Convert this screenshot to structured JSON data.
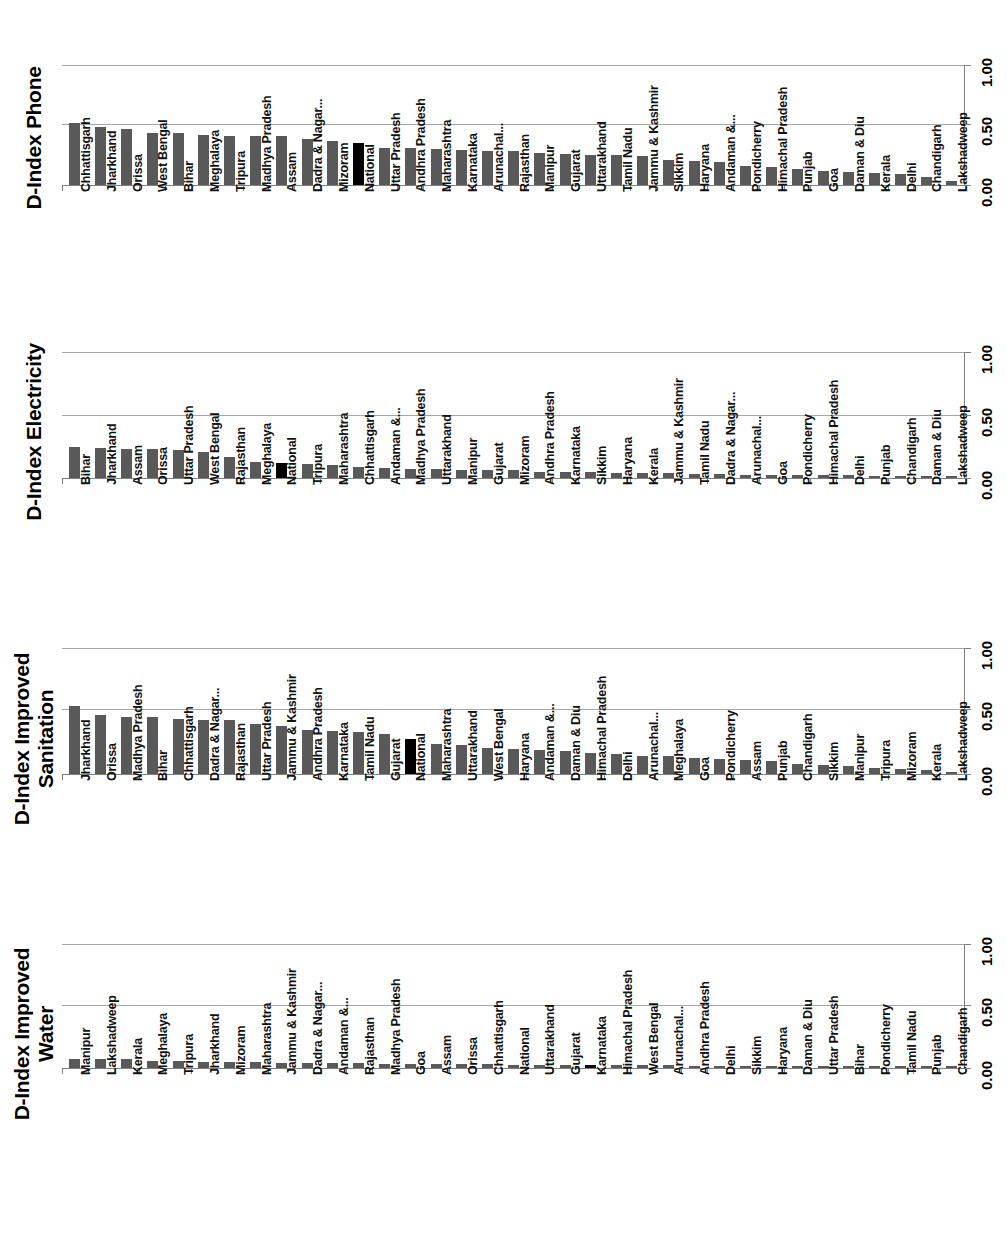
{
  "figure": {
    "axis_ticks": [
      "0.00",
      "0.50",
      "1.00"
    ],
    "axis_min": 0,
    "axis_max": 1,
    "bar_color": "#595959",
    "highlight_color": "#000000",
    "highlight_category": "National",
    "gridline_color": "#a6a6a6"
  },
  "chart_data": [
    {
      "type": "bar",
      "title": "D-Index Phone",
      "xlabel": "",
      "ylabel": "",
      "ylim": [
        0,
        1
      ],
      "yticks": [
        0.0,
        0.5,
        1.0
      ],
      "ytick_labels": [
        "0.00",
        "0.50",
        "1.00"
      ],
      "grid": true,
      "orientation": "rotated-90",
      "highlight": "National",
      "categories": [
        "Chhattisgarh",
        "Jharkhand",
        "Orissa",
        "West Bengal",
        "Bihar",
        "Meghalaya",
        "Tripura",
        "Madhya Pradesh",
        "Assam",
        "Dadra & Nagar...",
        "Mizoram",
        "National",
        "Uttar Pradesh",
        "Andhra Pradesh",
        "Maharashtra",
        "Karnataka",
        "Arunachal...",
        "Rajasthan",
        "Manipur",
        "Gujarat",
        "Uttarakhand",
        "Tamil Nadu",
        "Jammu & Kashmir",
        "Sikkim",
        "Haryana",
        "Andaman &...",
        "Pondicherry",
        "Himachal Pradesh",
        "Punjab",
        "Goa",
        "Daman & Diu",
        "Kerala",
        "Delhi",
        "Chandigarh",
        "Lakshadweep"
      ],
      "values": [
        0.52,
        0.48,
        0.47,
        0.43,
        0.43,
        0.42,
        0.41,
        0.41,
        0.41,
        0.38,
        0.37,
        0.35,
        0.31,
        0.31,
        0.3,
        0.29,
        0.28,
        0.28,
        0.27,
        0.26,
        0.25,
        0.25,
        0.24,
        0.21,
        0.2,
        0.19,
        0.16,
        0.15,
        0.13,
        0.12,
        0.11,
        0.1,
        0.09,
        0.07,
        0.03
      ]
    },
    {
      "type": "bar",
      "title": "D-Index Electricity",
      "xlabel": "",
      "ylabel": "",
      "ylim": [
        0,
        1
      ],
      "yticks": [
        0.0,
        0.5,
        1.0
      ],
      "ytick_labels": [
        "0.00",
        "0.50",
        "1.00"
      ],
      "grid": true,
      "orientation": "rotated-90",
      "highlight": "National",
      "categories": [
        "Bihar",
        "Jharkhand",
        "Assam",
        "Orissa",
        "Uttar Pradesh",
        "West Bengal",
        "Rajasthan",
        "Meghalaya",
        "National",
        "Tripura",
        "Maharashtra",
        "Chhattisgarh",
        "Andaman &...",
        "Madhya Pradesh",
        "Uttarakhand",
        "Manipur",
        "Gujarat",
        "Mizoram",
        "Andhra Pradesh",
        "Karnataka",
        "Sikkim",
        "Haryana",
        "Kerala",
        "Jammu & Kashmir",
        "Tamil Nadu",
        "Dadra & Nagar...",
        "Arunachal...",
        "Goa",
        "Pondicherry",
        "Himachal Pradesh",
        "Delhi",
        "Punjab",
        "Chandigarh",
        "Daman & Diu",
        "Lakshadweep"
      ],
      "values": [
        0.25,
        0.24,
        0.23,
        0.23,
        0.22,
        0.21,
        0.17,
        0.13,
        0.12,
        0.11,
        0.1,
        0.09,
        0.08,
        0.07,
        0.07,
        0.06,
        0.06,
        0.06,
        0.05,
        0.05,
        0.05,
        0.04,
        0.04,
        0.04,
        0.03,
        0.03,
        0.02,
        0.02,
        0.02,
        0.02,
        0.02,
        0.01,
        0.01,
        0.01,
        0.0
      ]
    },
    {
      "type": "bar",
      "title": "D-Index Improved\nSanitation",
      "xlabel": "",
      "ylabel": "",
      "ylim": [
        0,
        1
      ],
      "yticks": [
        0.0,
        0.5,
        1.0
      ],
      "ytick_labels": [
        "0.00",
        "0.50",
        "1.00"
      ],
      "grid": true,
      "orientation": "rotated-90",
      "highlight": "National",
      "categories": [
        "Jharkhand",
        "Orissa",
        "Madhya Pradesh",
        "Bihar",
        "Chhattisgarh",
        "Dadra & Nagar...",
        "Rajasthan",
        "Uttar Pradesh",
        "Jammu & Kashmir",
        "Andhra Pradesh",
        "Karnataka",
        "Tamil Nadu",
        "Gujarat",
        "National",
        "Maharashtra",
        "Uttarakhand",
        "West Bengal",
        "Haryana",
        "Andaman &...",
        "Daman & Diu",
        "Himachal Pradesh",
        "Delhi",
        "Arunachal...",
        "Meghalaya",
        "Goa",
        "Pondicherry",
        "Assam",
        "Punjab",
        "Chandigarh",
        "Sikkim",
        "Manipur",
        "Tripura",
        "Mizoram",
        "Kerala",
        "Lakshadweep"
      ],
      "values": [
        0.54,
        0.47,
        0.45,
        0.45,
        0.44,
        0.43,
        0.43,
        0.4,
        0.38,
        0.35,
        0.34,
        0.33,
        0.32,
        0.28,
        0.24,
        0.23,
        0.21,
        0.2,
        0.19,
        0.18,
        0.17,
        0.16,
        0.14,
        0.14,
        0.13,
        0.12,
        0.11,
        0.1,
        0.08,
        0.07,
        0.06,
        0.05,
        0.04,
        0.03,
        0.01
      ]
    },
    {
      "type": "bar",
      "title": "D-Index Improved\nWater",
      "xlabel": "",
      "ylabel": "",
      "ylim": [
        0,
        1
      ],
      "yticks": [
        0.0,
        0.5,
        1.0
      ],
      "ytick_labels": [
        "0.00",
        "0.50",
        "1.00"
      ],
      "grid": true,
      "orientation": "rotated-90",
      "highlight": "Karnataka",
      "categories": [
        "Manipur",
        "Lakshadweep",
        "Kerala",
        "Meghalaya",
        "Tripura",
        "Jharkhand",
        "Mizoram",
        "Maharashtra",
        "Jammu & Kashmir",
        "Dadra & Nagar...",
        "Andaman &...",
        "Rajasthan",
        "Madhya Pradesh",
        "Goa",
        "Assam",
        "Orissa",
        "Chhattisgarh",
        "National",
        "Uttarakhand",
        "Gujarat",
        "Karnataka",
        "Himachal Pradesh",
        "West Bengal",
        "Arunachal...",
        "Andhra Pradesh",
        "Delhi",
        "Sikkim",
        "Haryana",
        "Daman & Diu",
        "Uttar Pradesh",
        "Bihar",
        "Pondicherry",
        "Tamil Nadu",
        "Punjab",
        "Chandigarh"
      ],
      "values": [
        0.075,
        0.075,
        0.07,
        0.06,
        0.057,
        0.05,
        0.047,
        0.045,
        0.042,
        0.042,
        0.04,
        0.038,
        0.036,
        0.034,
        0.032,
        0.03,
        0.029,
        0.028,
        0.027,
        0.026,
        0.026,
        0.024,
        0.023,
        0.021,
        0.02,
        0.018,
        0.017,
        0.016,
        0.014,
        0.013,
        0.011,
        0.009,
        0.007,
        0.005,
        0.003
      ]
    }
  ]
}
